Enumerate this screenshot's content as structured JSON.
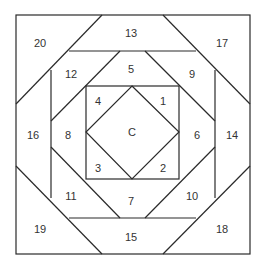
{
  "diagram": {
    "type": "pineapple-quilt-block",
    "line_color": "#2a2a2a",
    "text_color": "#333333",
    "pieces": [
      {
        "id": "C",
        "label": "C"
      },
      {
        "id": "1",
        "label": "1"
      },
      {
        "id": "2",
        "label": "2"
      },
      {
        "id": "3",
        "label": "3"
      },
      {
        "id": "4",
        "label": "4"
      },
      {
        "id": "5",
        "label": "5"
      },
      {
        "id": "6",
        "label": "6"
      },
      {
        "id": "7",
        "label": "7"
      },
      {
        "id": "8",
        "label": "8"
      },
      {
        "id": "9",
        "label": "9"
      },
      {
        "id": "10",
        "label": "10"
      },
      {
        "id": "11",
        "label": "11"
      },
      {
        "id": "12",
        "label": "12"
      },
      {
        "id": "13",
        "label": "13"
      },
      {
        "id": "14",
        "label": "14"
      },
      {
        "id": "15",
        "label": "15"
      },
      {
        "id": "16",
        "label": "16"
      },
      {
        "id": "17",
        "label": "17"
      },
      {
        "id": "18",
        "label": "18"
      },
      {
        "id": "19",
        "label": "19"
      },
      {
        "id": "20",
        "label": "20"
      }
    ]
  }
}
